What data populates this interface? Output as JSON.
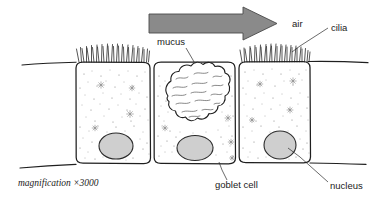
{
  "diagram": {
    "magnification_text": "magnification  ×3000",
    "colors": {
      "ink": "#1f1f1f",
      "arrow_fill": "#8a8a8a",
      "arrow_stroke": "#4a4a4a",
      "nucleus_fill": "#cfcfcf",
      "stipple": "#6e6e6e",
      "background": "#ffffff"
    },
    "labels": [
      {
        "id": "air",
        "text": "air",
        "x": 292,
        "y": 22
      },
      {
        "id": "cilia",
        "text": "cilia",
        "x": 331,
        "y": 27
      },
      {
        "id": "mucus",
        "text": "mucus",
        "x": 157,
        "y": 44
      },
      {
        "id": "goblet-cell",
        "text": "goblet cell",
        "x": 215,
        "y": 185
      },
      {
        "id": "nucleus",
        "text": "nucleus",
        "x": 330,
        "y": 186
      }
    ],
    "arrow": {
      "id": "airflow-arrow",
      "direction": "right",
      "description": "grey block arrow showing direction of air flow"
    },
    "cells": [
      {
        "id": "ciliated-cell-left",
        "type": "ciliated cell",
        "has_cilia": true,
        "has_nucleus": true
      },
      {
        "id": "goblet-cell",
        "type": "goblet cell",
        "has_cilia": false,
        "has_nucleus": true,
        "secretes": "mucus"
      },
      {
        "id": "ciliated-cell-right",
        "type": "ciliated cell",
        "has_cilia": true,
        "has_nucleus": true
      }
    ],
    "structures": [
      {
        "id": "mucus-blob",
        "name": "mucus"
      },
      {
        "id": "basement-membrane",
        "name": "basement membrane"
      }
    ]
  }
}
